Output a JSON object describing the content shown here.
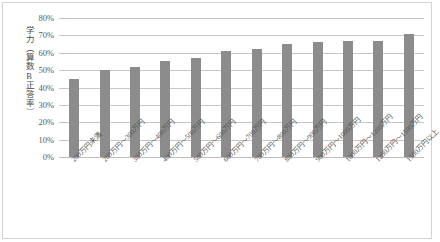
{
  "chart_data": {
    "type": "bar",
    "title": "",
    "xlabel": "",
    "ylabel": "学力（算数B正答率）",
    "ylim": [
      0,
      80
    ],
    "ytick_labels": [
      "80%",
      "70%",
      "60%",
      "50%",
      "40%",
      "30%",
      "20%",
      "10%",
      "0%"
    ],
    "ytick_values": [
      80,
      70,
      60,
      50,
      40,
      30,
      20,
      10,
      0
    ],
    "grid": true,
    "legend": "none",
    "bar_color": "#8c8c8c",
    "categories": [
      "200万円未満",
      "200万円～300万円",
      "300万円～400万円",
      "400万円～500万円",
      "500万円～600万円",
      "600万円～700万円",
      "700万円～800万円",
      "800万円～900万円",
      "900万円～1000万円",
      "1000万円～1200万円",
      "1200万円～1500万円",
      "1500万円以上"
    ],
    "values": [
      45,
      50,
      52,
      55,
      57,
      61,
      62,
      65,
      66,
      67,
      67,
      71
    ]
  }
}
